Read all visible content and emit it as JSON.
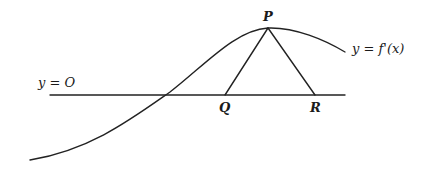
{
  "diagram": {
    "type": "geometry-sketch",
    "background": "#ffffff",
    "line_color": "#222222",
    "labels": {
      "axis": "y = O",
      "curve": "y = f'(x)",
      "point_p": "P",
      "point_q": "Q",
      "point_r": "R"
    },
    "points": {
      "P": {
        "x": 268,
        "y": 28
      },
      "Q": {
        "x": 225,
        "y": 95
      },
      "R": {
        "x": 315,
        "y": 95
      }
    },
    "axis_line": {
      "x1": 50,
      "y1": 95,
      "x2": 345,
      "y2": 95
    },
    "curve_path": "M 30 160 C 90 150, 130 120, 170 92 C 205 65, 235 30, 268 28 C 295 27, 325 40, 345 52",
    "segments": [
      {
        "name": "PQ",
        "from": "P",
        "to": "Q"
      },
      {
        "name": "PR",
        "from": "P",
        "to": "R"
      }
    ]
  }
}
